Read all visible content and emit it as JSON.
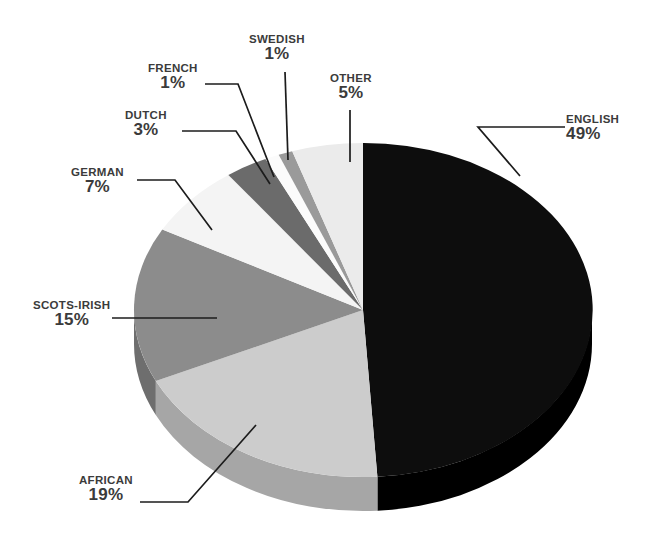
{
  "chart_data": {
    "type": "pie",
    "title": "",
    "subtitle": "",
    "xlabel": "",
    "ylabel": "",
    "legend_position": "callout-labels",
    "grid": false,
    "three_d": true,
    "value_suffix": "%",
    "start_angle_deg": 0,
    "direction": "clockwise",
    "categories": [
      "ENGLISH",
      "AFRICAN",
      "SCOTS-IRISH",
      "GERMAN",
      "OTHER",
      "DUTCH",
      "FRENCH",
      "SWEDISH"
    ],
    "values": [
      49,
      19,
      15,
      7,
      5,
      3,
      1,
      1
    ],
    "slices": [
      {
        "label": "ENGLISH",
        "value": 49,
        "value_text": "49%",
        "color": "#0d0d0d",
        "side_color": "#000000"
      },
      {
        "label": "AFRICAN",
        "value": 19,
        "value_text": "19%",
        "color": "#cccccc",
        "side_color": "#a6a6a6"
      },
      {
        "label": "SCOTS-IRISH",
        "value": 15,
        "value_text": "15%",
        "color": "#8c8c8c",
        "side_color": "#6e6e6e"
      },
      {
        "label": "GERMAN",
        "value": 7,
        "value_text": "7%",
        "color": "#f4f4f4",
        "side_color": "#c9c9c9"
      },
      {
        "label": "DUTCH",
        "value": 3,
        "value_text": "3%",
        "color": "#6b6b6b",
        "side_color": "#545454"
      },
      {
        "label": "FRENCH",
        "value": 1,
        "value_text": "1%",
        "color": "#fbfbfb",
        "side_color": "#d0d0d0"
      },
      {
        "label": "SWEDISH",
        "value": 1,
        "value_text": "1%",
        "color": "#9a9a9a",
        "side_color": "#7b7b7b"
      },
      {
        "label": "OTHER",
        "value": 5,
        "value_text": "5%",
        "color": "#ebebeb",
        "side_color": "#c0c0c0"
      }
    ],
    "total": 100,
    "text_color": "#3b3b3b",
    "background_color": "#ffffff",
    "leader_line_color": "#1c1c1c"
  },
  "labels": {
    "english": {
      "category": "ENGLISH",
      "value": "49%"
    },
    "other": {
      "category": "OTHER",
      "value": "5%"
    },
    "swedish": {
      "category": "SWEDISH",
      "value": "1%"
    },
    "french": {
      "category": "FRENCH",
      "value": "1%"
    },
    "dutch": {
      "category": "DUTCH",
      "value": "3%"
    },
    "german": {
      "category": "GERMAN",
      "value": "7%"
    },
    "scots": {
      "category": "SCOTS-IRISH",
      "value": "15%"
    },
    "african": {
      "category": "AFRICAN",
      "value": "19%"
    }
  }
}
